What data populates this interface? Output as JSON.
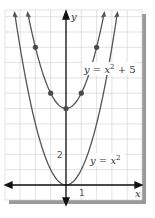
{
  "chart_data": {
    "type": "line",
    "title": "",
    "xlabel": "x",
    "ylabel": "y",
    "xlim": [
      -4,
      4.5
    ],
    "ylim": [
      -1,
      11.5
    ],
    "grid": true,
    "tick_labels": {
      "x": [
        "1"
      ],
      "y": [
        "2"
      ]
    },
    "series": [
      {
        "name": "y = x^2",
        "label_text": "y = x",
        "label_sup": "2",
        "function": "x^2",
        "x": [
          -3.4,
          -3,
          -2,
          -1,
          0,
          1,
          2,
          3,
          3.4
        ],
        "y": [
          11.56,
          9,
          4,
          1,
          0,
          1,
          4,
          9,
          11.56
        ],
        "marked_points": [
          [
            0,
            0
          ]
        ]
      },
      {
        "name": "y = x^2 + 5",
        "label_text": "y = x",
        "label_sup": "2",
        "label_suffix": " + 5",
        "function": "x^2 + 5",
        "x": [
          -2.55,
          -2,
          -1,
          0,
          1,
          2,
          2.55
        ],
        "y": [
          11.5,
          9,
          6,
          5,
          6,
          9,
          11.5
        ],
        "marked_points": [
          [
            -2,
            9
          ],
          [
            -1,
            6
          ],
          [
            0,
            5
          ],
          [
            1,
            6
          ],
          [
            2,
            9
          ]
        ]
      }
    ],
    "colors": {
      "curve": "#555555",
      "axis": "#111111",
      "grid": "#cfcfcf",
      "shadow": "#9a9a9a",
      "point": "#4a4a4a"
    }
  }
}
